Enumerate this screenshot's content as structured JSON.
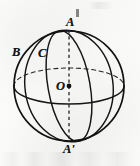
{
  "figure": {
    "kind": "geometry-diagram",
    "width": 140,
    "height": 166,
    "background_color": "#fbfbfa",
    "ink_color": "#1a1a1a"
  },
  "labels": {
    "north_pole": "A",
    "south_pole": "A'",
    "point_b": "B",
    "point_c": "C",
    "center": "O"
  },
  "geometry": {
    "sphere": {
      "cx": 69,
      "cy": 86,
      "r": 55,
      "stroke": "#1a1a1a",
      "stroke_width": 1.5
    },
    "axis": {
      "label": "polar-axis",
      "x": 69,
      "y1": 30,
      "y2": 142,
      "style": "dashed",
      "dash": "3.2 3.0",
      "stroke": "#1d1d1d",
      "stroke_width": 1.2
    },
    "center_dot": {
      "cx": 69,
      "cy": 86,
      "r": 2.4,
      "fill": "#121212"
    },
    "equator": {
      "label": "equator-ellipse",
      "cx": 69,
      "cy": 86,
      "rx": 55,
      "ry": 18,
      "back_half_style": "dashed",
      "front_half_style": "solid",
      "stroke": "#1a1a1a"
    },
    "meridian_front": {
      "label": "tilted-meridian-through-C",
      "cx": 69,
      "cy": 86,
      "rx": 21,
      "ry": 56,
      "rotation_deg": -10,
      "stroke": "#1a1a1a",
      "style": "solid"
    },
    "meridian_outer": {
      "label": "left-meridian-through-B",
      "cx": 69,
      "cy": 86,
      "rx": 44,
      "ry": 56,
      "rotation_deg": -8,
      "stroke": "#1a1a1a",
      "style": "solid"
    }
  }
}
